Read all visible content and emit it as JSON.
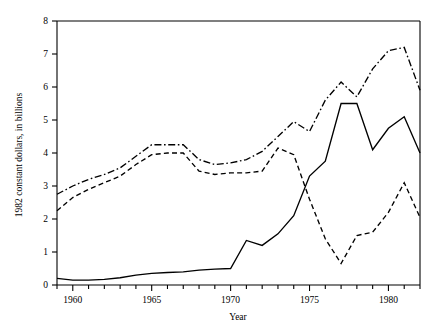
{
  "chart_data": {
    "type": "line",
    "title": "",
    "xlabel": "Year",
    "ylabel": "1982 constant dollars, in billions",
    "xlim": [
      1959,
      1982
    ],
    "ylim": [
      0,
      8
    ],
    "grid": false,
    "legend": "none",
    "x_ticks_major": [
      1960,
      1965,
      1970,
      1975,
      1980
    ],
    "x_tick_labels": [
      "1960",
      "1965",
      "1970",
      "1975",
      "1980"
    ],
    "x_ticks_minor_step": 1,
    "y_ticks": [
      0,
      1,
      2,
      3,
      4,
      5,
      6,
      7,
      8
    ],
    "y_tick_labels": [
      "0",
      "1",
      "2",
      "3",
      "4",
      "5",
      "6",
      "7",
      "8"
    ],
    "x": [
      1959,
      1960,
      1961,
      1962,
      1963,
      1964,
      1965,
      1966,
      1967,
      1968,
      1969,
      1970,
      1971,
      1972,
      1973,
      1974,
      1975,
      1976,
      1977,
      1978,
      1979,
      1980,
      1981,
      1982
    ],
    "series": [
      {
        "name": "dash-dot-series",
        "style": "dashdot",
        "color": "#000000",
        "values": [
          2.75,
          3.0,
          3.2,
          3.35,
          3.55,
          3.9,
          4.25,
          4.25,
          4.25,
          3.8,
          3.65,
          3.7,
          3.8,
          4.05,
          4.5,
          4.95,
          4.65,
          5.6,
          6.15,
          5.7,
          6.55,
          7.1,
          7.2,
          5.9
        ]
      },
      {
        "name": "solid-series",
        "style": "solid",
        "color": "#000000",
        "values": [
          0.2,
          0.15,
          0.15,
          0.17,
          0.22,
          0.3,
          0.35,
          0.38,
          0.4,
          0.45,
          0.48,
          0.5,
          1.35,
          1.2,
          1.55,
          2.1,
          3.3,
          3.75,
          5.5,
          5.5,
          4.1,
          4.75,
          5.1,
          4.0
        ]
      },
      {
        "name": "dashed-series",
        "style": "dashed",
        "color": "#000000",
        "values": [
          2.25,
          2.65,
          2.9,
          3.1,
          3.3,
          3.65,
          3.95,
          4.0,
          4.0,
          3.45,
          3.35,
          3.4,
          3.4,
          3.45,
          4.15,
          3.95,
          2.6,
          1.4,
          0.65,
          1.5,
          1.6,
          2.2,
          3.1,
          2.05
        ]
      }
    ]
  },
  "axes": {
    "x_label": "Year",
    "y_label": "1982 constant dollars, in billions"
  }
}
